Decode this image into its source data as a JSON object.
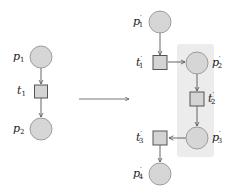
{
  "diagram": {
    "type": "petri-net-transformation",
    "colors": {
      "place_fill": "#d6d6d6",
      "place_stroke": "#8a8a8a",
      "transition_fill": "#d4d4d4",
      "transition_stroke": "#555555",
      "edge": "#555555",
      "highlight": "#ececec"
    },
    "left_net": {
      "places": [
        {
          "id": "p1",
          "base": "p",
          "sub": "1",
          "prime": ""
        },
        {
          "id": "p2",
          "base": "p",
          "sub": "2",
          "prime": ""
        }
      ],
      "transitions": [
        {
          "id": "t1",
          "base": "t",
          "sub": "1",
          "prime": ""
        }
      ],
      "edges": [
        [
          "p1",
          "t1"
        ],
        [
          "t1",
          "p2"
        ]
      ]
    },
    "transformation_arrow": "→",
    "right_net": {
      "places": [
        {
          "id": "p1'",
          "base": "p",
          "sub": "1",
          "prime": "′"
        },
        {
          "id": "p2'",
          "base": "p",
          "sub": "2",
          "prime": "′"
        },
        {
          "id": "p3'",
          "base": "p",
          "sub": "3",
          "prime": "′"
        },
        {
          "id": "p4'",
          "base": "p",
          "sub": "4",
          "prime": "′"
        }
      ],
      "transitions": [
        {
          "id": "t1'",
          "base": "t",
          "sub": "1",
          "prime": "′"
        },
        {
          "id": "t2'",
          "base": "t",
          "sub": "2",
          "prime": "′"
        },
        {
          "id": "t3'",
          "base": "t",
          "sub": "3",
          "prime": "′"
        }
      ],
      "edges": [
        [
          "p1'",
          "t1'"
        ],
        [
          "t1'",
          "p2'"
        ],
        [
          "p2'",
          "t2'"
        ],
        [
          "t2'",
          "p3'"
        ],
        [
          "p3'",
          "t3'"
        ],
        [
          "t3'",
          "p4'"
        ]
      ],
      "highlighted": [
        "p2'",
        "t2'",
        "p3'"
      ]
    }
  }
}
